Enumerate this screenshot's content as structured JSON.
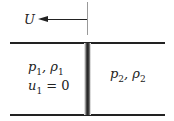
{
  "diagram": {
    "velocity_label": "U",
    "region1": {
      "pressure": "p",
      "density": "ρ",
      "subscript": "1",
      "velocity": "u",
      "velocity_eq": "= 0"
    },
    "region2": {
      "pressure": "p",
      "density": "ρ",
      "subscript": "2"
    },
    "separator": ", "
  }
}
